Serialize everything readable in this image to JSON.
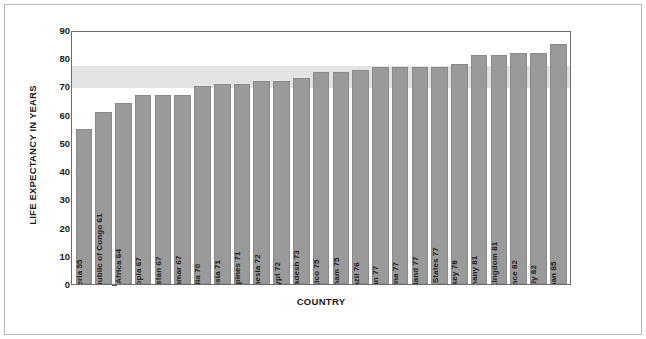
{
  "chart_data": {
    "type": "bar",
    "title": "",
    "xlabel": "COUNTRY",
    "ylabel": "LIFE EXPECTANCY IN YEARS",
    "ylim": [
      0,
      90
    ],
    "yticks": [
      0,
      10,
      20,
      30,
      40,
      50,
      60,
      70,
      80,
      90
    ],
    "grid": false,
    "legend": "none",
    "orientation": "vertical",
    "bar_color": "#9a9a9a",
    "band_color": "#e3e3e3",
    "band_range": [
      70,
      78
    ],
    "categories": [
      "Nigeria",
      "Democratic Republic of Congo",
      "South Africa",
      "Ethiopia",
      "Pakistan",
      "Myanmar",
      "India",
      "Russia",
      "Philippines",
      "Indonesia",
      "Egypt",
      "Bangladesh",
      "Mexico",
      "Vietnam",
      "Brazil",
      "Iran",
      "China",
      "Thailand",
      "United States",
      "Turkey",
      "Germany",
      "United Kingdom",
      "France",
      "Italy",
      "Japan"
    ],
    "values": [
      55,
      61,
      64,
      67,
      67,
      67,
      70,
      71,
      71,
      72,
      72,
      73,
      75,
      75,
      76,
      77,
      77,
      77,
      77,
      78,
      81,
      81,
      82,
      82,
      85
    ],
    "bar_labels": [
      "Nigeria 55",
      "Democratic Republic of Congo 61",
      "South Africa 64",
      "Ethiopia 67",
      "Pakistan 67",
      "Myanmar 67",
      "India 70",
      "Russia 71",
      "Philippines 71",
      "Indonesia 72",
      "Egypt 72",
      "Bangladesh 73",
      "Mexico 75",
      "Vietnam 75",
      "Brazil 76",
      "Iran 77",
      "China 77",
      "Thailand 77",
      "United States 77",
      "Turkey 78",
      "Germany 81",
      "United Kingdom 81",
      "France 82",
      "Italy 82",
      "Japan 85"
    ]
  },
  "axes": {
    "y_title": "LIFE EXPECTANCY IN YEARS",
    "x_title": "COUNTRY",
    "y_tick_labels": [
      "90",
      "80",
      "70",
      "60",
      "50",
      "40",
      "30",
      "20",
      "10",
      "0"
    ]
  }
}
